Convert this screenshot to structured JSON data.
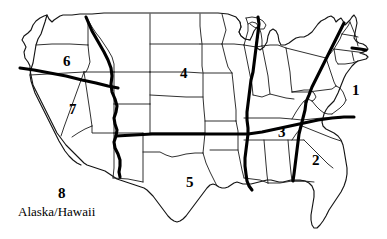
{
  "figure": {
    "background_color": "#ffffff",
    "line_color": "#000000",
    "divider_color": "#000000"
  },
  "regions": [
    {
      "id": "region-1",
      "number": "1",
      "x": 352,
      "y": 83,
      "area": "Northeast"
    },
    {
      "id": "region-2",
      "number": "2",
      "x": 312,
      "y": 153,
      "area": "Southeast"
    },
    {
      "id": "region-3",
      "number": "3",
      "x": 278,
      "y": 125,
      "area": "Mid-South"
    },
    {
      "id": "region-4",
      "number": "4",
      "x": 180,
      "y": 66,
      "area": "Upper Midwest"
    },
    {
      "id": "region-5",
      "number": "5",
      "x": 186,
      "y": 175,
      "area": "South Central"
    },
    {
      "id": "region-6",
      "number": "6",
      "x": 63,
      "y": 54,
      "area": "Northwest"
    },
    {
      "id": "region-7",
      "number": "7",
      "x": 69,
      "y": 102,
      "area": "West"
    }
  ],
  "offshore": {
    "number": "8",
    "number_x": 58,
    "number_y": 186,
    "caption": "Alaska/Hawaii",
    "caption_x": 18,
    "caption_y": 205
  }
}
